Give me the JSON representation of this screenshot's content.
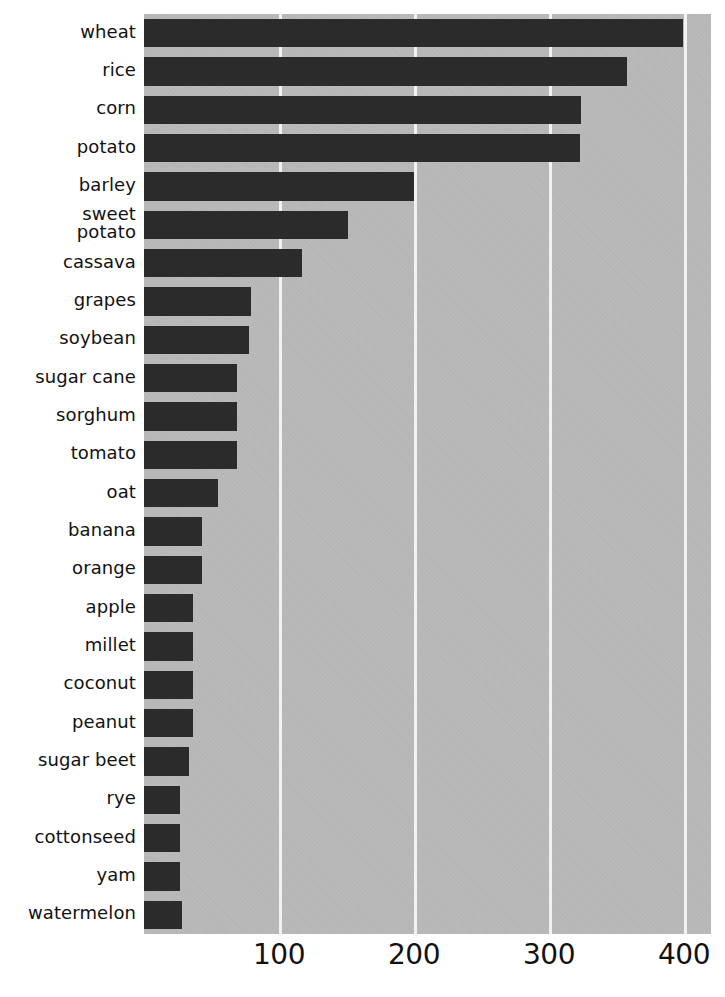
{
  "chart_data": {
    "type": "bar",
    "orientation": "horizontal",
    "title": "",
    "subtitle": "",
    "xlabel": "",
    "ylabel": "",
    "xlim": [
      0,
      420
    ],
    "xticks": [
      100,
      200,
      300,
      400
    ],
    "xtick_labels": [
      "100",
      "200",
      "300",
      "400"
    ],
    "grid": "vertical",
    "legend": "none",
    "categories": [
      "wheat",
      "rice",
      "corn",
      "potato",
      "barley",
      "sweet\npotato",
      "cassava",
      "grapes",
      "soybean",
      "sugar cane",
      "sorghum",
      "tomato",
      "oat",
      "banana",
      "orange",
      "apple",
      "millet",
      "coconut",
      "peanut",
      "sugar beet",
      "rye",
      "cottonseed",
      "yam",
      "watermelon"
    ],
    "values": [
      399,
      358,
      324,
      323,
      200,
      151,
      117,
      79,
      78,
      69,
      69,
      69,
      55,
      43,
      43,
      36,
      36,
      36,
      36,
      33,
      27,
      27,
      27,
      28
    ],
    "colors": {
      "bar": "#2b2b2b",
      "plot_background": "#b9b9b9",
      "gridline": "#f2f2f2",
      "page_background": "#ffffff",
      "text": "#111111"
    }
  }
}
